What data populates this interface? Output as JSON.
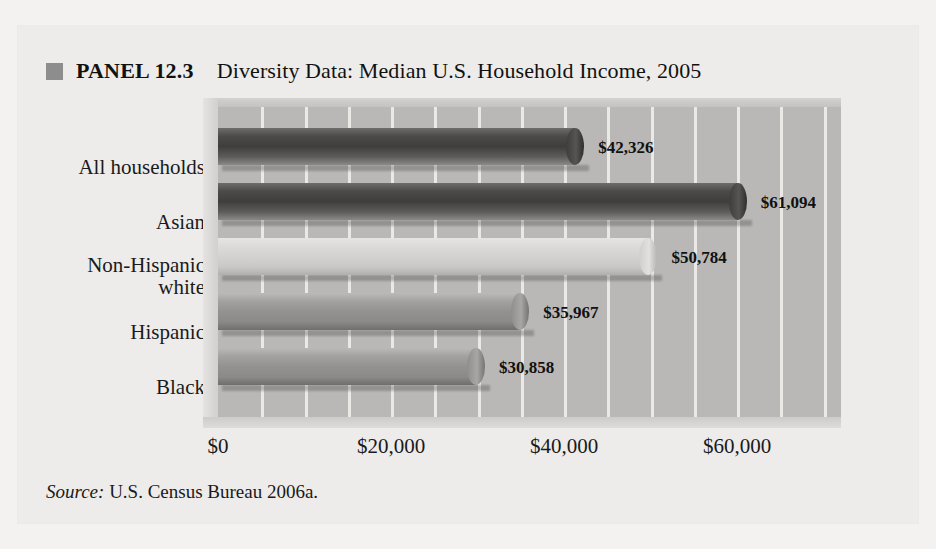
{
  "panel": {
    "bullet_icon": "square-bullet-icon",
    "label": "PANEL 12.3",
    "title": "Diversity Data: Median U.S. Household Income, 2005",
    "source_prefix": "Source:",
    "source_text": " U.S. Census Bureau 2006a."
  },
  "chart_data": {
    "type": "bar",
    "orientation": "horizontal",
    "title": "Diversity Data: Median U.S. Household Income, 2005",
    "xlabel": "",
    "ylabel": "",
    "categories": [
      "All households",
      "Asian",
      "Non-Hispanic white",
      "Hispanic",
      "Black"
    ],
    "values": [
      42326,
      61094,
      50784,
      35967,
      30858
    ],
    "value_labels": [
      "$42,326",
      "$61,094",
      "$50,784",
      "$35,967",
      "$30,858"
    ],
    "series": [
      {
        "name": "Median household income",
        "values": [
          42326,
          61094,
          50784,
          35967,
          30858
        ]
      }
    ],
    "bar_tones": [
      "dark",
      "dark",
      "light",
      "mid",
      "mid"
    ],
    "xlim": [
      0,
      72000
    ],
    "xticks": [
      0,
      20000,
      40000,
      60000
    ],
    "xtick_labels": [
      "$0",
      "$20,000",
      "$40,000",
      "$60,000"
    ],
    "grid_interval": 5000,
    "grid": true,
    "legend": "none",
    "colors": {
      "bar_dark": "#3f3e3c",
      "bar_light": "#d3d2d0",
      "bar_mid": "#939290",
      "plot_background": "#b9b8b6",
      "gridline": "#f0efed",
      "panel_background": "#edecea",
      "bullet": "#8d8d8d",
      "text": "#1a1a1a"
    }
  }
}
